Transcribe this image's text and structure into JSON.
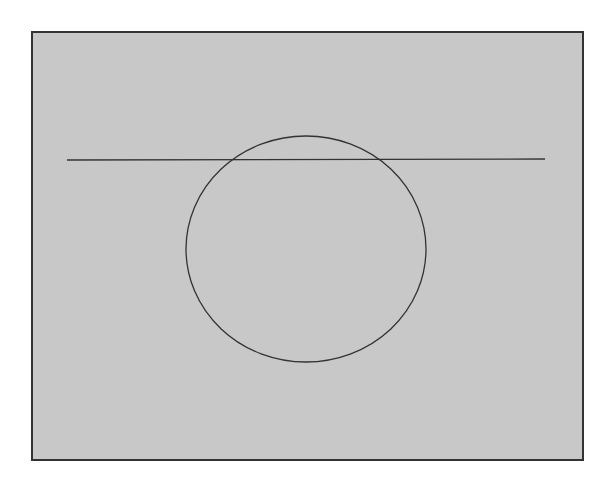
{
  "diagram": {
    "frame": {
      "x": 32,
      "y": 32,
      "width": 550,
      "height": 426,
      "fill": "#c8c8c8",
      "stroke": "#333333"
    },
    "line": {
      "x1": 67,
      "y1": 160,
      "x2": 545,
      "y2": 159,
      "stroke": "#333333"
    },
    "circle": {
      "cx": 306,
      "cy": 249,
      "rx": 120,
      "ry": 113,
      "stroke": "#333333"
    }
  }
}
